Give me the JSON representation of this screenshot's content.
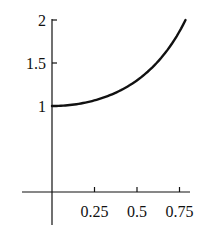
{
  "chart_data": {
    "type": "line",
    "title": "",
    "xlabel": "",
    "ylabel": "",
    "function": "sec^2(x)",
    "x_ticks": [
      0.25,
      0.5,
      0.75
    ],
    "x_tick_labels": [
      "0.25",
      "0.5",
      "0.75"
    ],
    "y_ticks": [
      1,
      1.5,
      2
    ],
    "y_tick_labels": [
      "1",
      "1.5",
      "2"
    ],
    "xlim": [
      -0.17,
      0.8
    ],
    "ylim": [
      -0.37,
      2
    ],
    "grid": false,
    "legend": null,
    "series": [
      {
        "name": "y = sec^2(x)",
        "x": [
          0,
          0.1,
          0.2,
          0.3,
          0.4,
          0.5,
          0.6,
          0.7,
          0.785
        ],
        "y": [
          1.0,
          1.01,
          1.042,
          1.095,
          1.179,
          1.298,
          1.466,
          1.704,
          2.0
        ]
      }
    ]
  }
}
